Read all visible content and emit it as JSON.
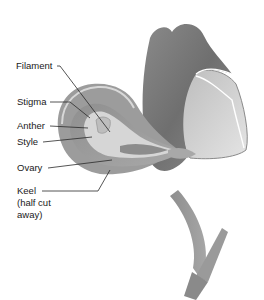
{
  "diagram": {
    "labels": [
      {
        "id": "filament",
        "text": "Filament",
        "x": 16,
        "y": 62
      },
      {
        "id": "stigma",
        "text": "Stigma",
        "x": 17,
        "y": 97
      },
      {
        "id": "anther",
        "text": "Anther",
        "x": 17,
        "y": 121
      },
      {
        "id": "style",
        "text": "Style",
        "x": 17,
        "y": 137
      },
      {
        "id": "ovary",
        "text": "Ovary",
        "x": 17,
        "y": 163
      },
      {
        "id": "keel",
        "text": "Keel",
        "x": 17,
        "y": 185
      },
      {
        "id": "keel-note-1",
        "text": "(half cut",
        "x": 17,
        "y": 197
      },
      {
        "id": "keel-note-2",
        "text": "away)",
        "x": 17,
        "y": 209
      }
    ],
    "colors": {
      "background": "#ffffff",
      "petal_dark": "#7a7a7a",
      "petal_mid": "#9a9a9a",
      "petal_light": "#c8c8c8",
      "petal_highlight": "#e6e6e6",
      "leader_line": "#2a2a2a",
      "text": "#1a1a1a"
    }
  }
}
